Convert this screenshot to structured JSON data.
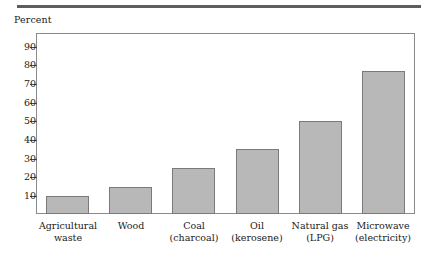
{
  "figure": {
    "top_rule": "horizontal-rule",
    "axis_title": "Percent"
  },
  "chart_data": {
    "type": "bar",
    "title": "",
    "subtitle": "",
    "xlabel": "",
    "ylabel": "Percent",
    "ylim": [
      0,
      100
    ],
    "ytick_labels": [
      "90",
      "80",
      "70",
      "60",
      "50",
      "40",
      "30",
      "20",
      "10"
    ],
    "ytick_values": [
      90,
      80,
      70,
      60,
      50,
      40,
      30,
      20,
      10
    ],
    "grid": false,
    "legend": "none",
    "bar_color": "#b8b8b8",
    "bar_edge_color": "#7a7a7a",
    "categories": [
      "Agricultural waste",
      "Wood",
      "Coal (charcoal)",
      "Oil (kerosene)",
      "Natural gas (LPG)",
      "Microwave (electricity)"
    ],
    "category_lines": [
      {
        "line1": "Agricultural",
        "line2": "waste"
      },
      {
        "line1": "Wood",
        "line2": ""
      },
      {
        "line1": "Coal",
        "line2": "(charcoal)"
      },
      {
        "line1": "Oil",
        "line2": "(kerosene)"
      },
      {
        "line1": "Natural gas",
        "line2": "(LPG)"
      },
      {
        "line1": "Microwave",
        "line2": "(electricity)"
      }
    ],
    "values": [
      10,
      15,
      25,
      35,
      50,
      77
    ]
  }
}
